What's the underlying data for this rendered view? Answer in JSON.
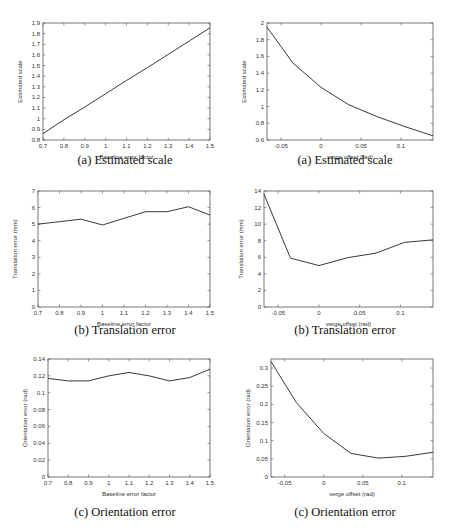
{
  "chart_data": [
    {
      "id": "left_a",
      "type": "line",
      "caption": "(a) Estimated scale",
      "xlabel": "Baseline error factor",
      "ylabel": "Estimated scale",
      "xlim": [
        0.7,
        1.5
      ],
      "ylim": [
        0.8,
        1.9
      ],
      "xticks": [
        0.7,
        0.8,
        0.9,
        1,
        1.1,
        1.2,
        1.3,
        1.4,
        1.5
      ],
      "yticks": [
        0.8,
        0.9,
        1,
        1.1,
        1.2,
        1.3,
        1.4,
        1.5,
        1.6,
        1.7,
        1.8,
        1.9
      ],
      "x": [
        0.7,
        0.8,
        0.9,
        1.0,
        1.1,
        1.2,
        1.3,
        1.4,
        1.5
      ],
      "y": [
        0.86,
        0.99,
        1.11,
        1.235,
        1.36,
        1.48,
        1.605,
        1.73,
        1.855
      ],
      "box": {
        "left": 43,
        "top": 23,
        "right": 210,
        "bottom": 140
      }
    },
    {
      "id": "right_a",
      "type": "line",
      "caption": "(a) Estimated scale",
      "xlabel": "verge offset (rad)",
      "ylabel": "Estimated scale",
      "xlim": [
        -0.0675,
        0.14
      ],
      "ylim": [
        0.6,
        2.0
      ],
      "xticks": [
        -0.05,
        0,
        0.05,
        0.1
      ],
      "yticks": [
        0.6,
        0.8,
        1,
        1.2,
        1.4,
        1.6,
        1.8,
        2
      ],
      "x": [
        -0.0675,
        -0.035,
        0.0,
        0.035,
        0.07,
        0.105,
        0.14
      ],
      "y": [
        1.95,
        1.52,
        1.23,
        1.02,
        0.88,
        0.76,
        0.65
      ],
      "box": {
        "left": 267,
        "top": 23,
        "right": 433,
        "bottom": 140
      }
    },
    {
      "id": "left_b",
      "type": "line",
      "caption": "(b) Translation error",
      "xlabel": "Baseline error factor",
      "ylabel": "Translation error (mm)",
      "xlim": [
        0.7,
        1.5
      ],
      "ylim": [
        0,
        7
      ],
      "xticks": [
        0.7,
        0.8,
        0.9,
        1,
        1.1,
        1.2,
        1.3,
        1.4,
        1.5
      ],
      "yticks": [
        0,
        1,
        2,
        3,
        4,
        5,
        6,
        7
      ],
      "x": [
        0.7,
        0.8,
        0.9,
        1.0,
        1.1,
        1.2,
        1.3,
        1.4,
        1.5
      ],
      "y": [
        5.0,
        5.15,
        5.3,
        4.95,
        5.35,
        5.75,
        5.75,
        6.05,
        5.55
      ],
      "box": {
        "left": 38,
        "top": 191,
        "right": 210,
        "bottom": 307
      }
    },
    {
      "id": "right_b",
      "type": "line",
      "caption": "(b) Translation error",
      "xlabel": "verge offset (rad)",
      "ylabel": "Translation error (mm)",
      "xlim": [
        -0.0675,
        0.14
      ],
      "ylim": [
        0,
        14
      ],
      "xticks": [
        -0.05,
        0,
        0.05,
        0.1
      ],
      "yticks": [
        0,
        2,
        4,
        6,
        8,
        10,
        12,
        14
      ],
      "x": [
        -0.0675,
        -0.035,
        0.0,
        0.035,
        0.07,
        0.105,
        0.14
      ],
      "y": [
        13.6,
        5.9,
        5.0,
        5.95,
        6.5,
        7.8,
        8.1
      ],
      "box": {
        "left": 264,
        "top": 191,
        "right": 433,
        "bottom": 307
      }
    },
    {
      "id": "left_c",
      "type": "line",
      "caption": "(c) Orientation error",
      "xlabel": "Baseline error factor",
      "ylabel": "Orientation error (rad)",
      "xlim": [
        0.7,
        1.5
      ],
      "ylim": [
        0,
        0.14
      ],
      "xticks": [
        0.7,
        0.8,
        0.9,
        1,
        1.1,
        1.2,
        1.3,
        1.4,
        1.5
      ],
      "yticks": [
        0,
        0.02,
        0.04,
        0.06,
        0.08,
        0.1,
        0.12,
        0.14
      ],
      "ytick_labels": [
        "0",
        "0.02",
        "0.04",
        "0.06",
        "0.08",
        "0.1",
        "0.12",
        "0.14"
      ],
      "x": [
        0.7,
        0.8,
        0.9,
        1.0,
        1.1,
        1.2,
        1.3,
        1.4,
        1.5
      ],
      "y": [
        0.117,
        0.114,
        0.114,
        0.12,
        0.124,
        0.12,
        0.114,
        0.118,
        0.128
      ],
      "box": {
        "left": 48,
        "top": 359,
        "right": 210,
        "bottom": 477
      }
    },
    {
      "id": "right_c",
      "type": "line",
      "caption": "(c) Orientation error",
      "xlabel": "verge offset (rad)",
      "ylabel": "Orientation error (rad)",
      "xlim": [
        -0.0675,
        0.14
      ],
      "ylim": [
        0,
        0.325
      ],
      "xticks": [
        -0.05,
        0,
        0.05,
        0.1
      ],
      "yticks": [
        0,
        0.05,
        0.1,
        0.15,
        0.2,
        0.25,
        0.3
      ],
      "x": [
        -0.0675,
        -0.035,
        0.0,
        0.035,
        0.07,
        0.105,
        0.14
      ],
      "y": [
        0.318,
        0.205,
        0.12,
        0.065,
        0.052,
        0.057,
        0.068
      ],
      "box": {
        "left": 271,
        "top": 359,
        "right": 433,
        "bottom": 477
      }
    }
  ]
}
